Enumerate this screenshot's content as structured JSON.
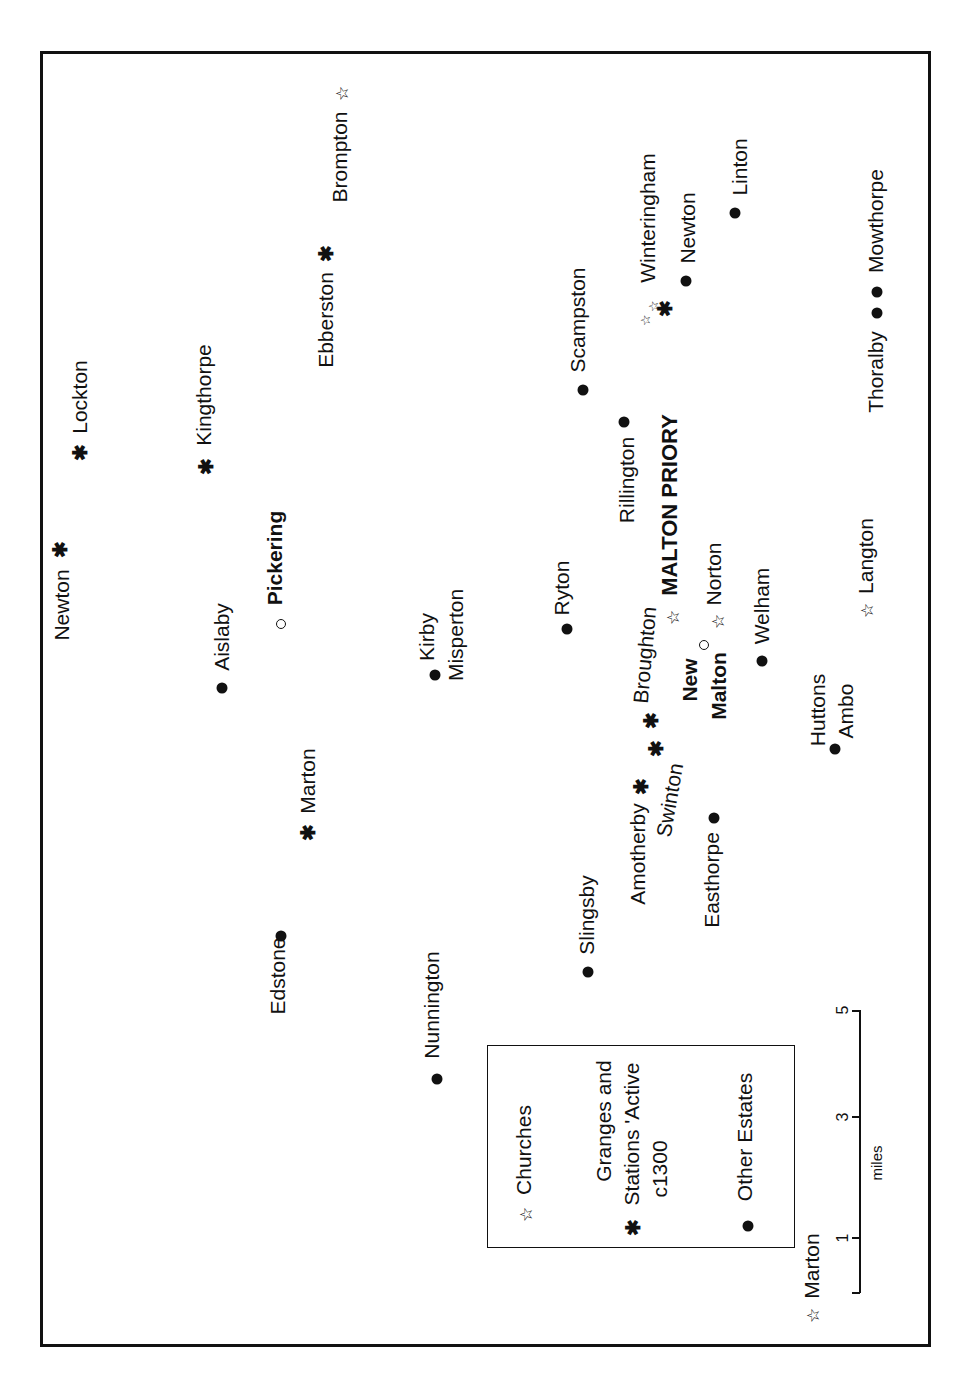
{
  "map": {
    "title": "MALTON PRIORY",
    "places": [
      {
        "id": "lockton",
        "name": "Lockton",
        "type": "grange"
      },
      {
        "id": "kingthorpe",
        "name": "Kingthorpe",
        "type": "grange"
      },
      {
        "id": "ebberston",
        "name": "Ebberston",
        "type": "grange"
      },
      {
        "id": "brompton",
        "name": "Brompton",
        "type": "church"
      },
      {
        "id": "newton-north",
        "name": "Newton",
        "type": "grange"
      },
      {
        "id": "aislaby",
        "name": "Aislaby",
        "type": "estate"
      },
      {
        "id": "pickering",
        "name": "Pickering",
        "type": "town"
      },
      {
        "id": "kirby-misperton",
        "name_line1": "Kirby",
        "name_line2": "Misperton",
        "type": "estate"
      },
      {
        "id": "marton-west",
        "name": "Marton",
        "type": "grange"
      },
      {
        "id": "edstone",
        "name": "Edstone",
        "type": "estate"
      },
      {
        "id": "nunnington",
        "name": "Nunnington",
        "type": "estate"
      },
      {
        "id": "slingsby",
        "name": "Slingsby",
        "type": "estate"
      },
      {
        "id": "amotherby",
        "name": "Amotherby",
        "type": "grange"
      },
      {
        "id": "swinton",
        "name": "Swinton",
        "type": "grange"
      },
      {
        "id": "easthorpe",
        "name": "Easthorpe",
        "type": "estate"
      },
      {
        "id": "broughton",
        "name": "Broughton",
        "type": "grange"
      },
      {
        "id": "ryton",
        "name": "Ryton",
        "type": "estate"
      },
      {
        "id": "rillington",
        "name": "Rillington",
        "type": "estate"
      },
      {
        "id": "scampston",
        "name": "Scampston",
        "type": "estate"
      },
      {
        "id": "malton-priory",
        "name": "MALTON PRIORY",
        "type": "church"
      },
      {
        "id": "new-malton",
        "name_line1": "New",
        "name_line2": "Malton",
        "type": "town"
      },
      {
        "id": "norton",
        "name": "Norton",
        "type": "church"
      },
      {
        "id": "welham",
        "name": "Welham",
        "type": "estate"
      },
      {
        "id": "huttons-ambo",
        "name_line1": "Huttons",
        "name_line2": "Ambo",
        "type": "estate"
      },
      {
        "id": "langton",
        "name": "Langton",
        "type": "church"
      },
      {
        "id": "winteringham",
        "name": "Winteringham",
        "type": "church+grange"
      },
      {
        "id": "newton-east",
        "name": "Newton",
        "type": "estate"
      },
      {
        "id": "linton",
        "name": "Linton",
        "type": "estate"
      },
      {
        "id": "thoralby",
        "name": "Thoralby",
        "type": "estate"
      },
      {
        "id": "mowthorpe",
        "name": "Mowthorpe",
        "type": "estate"
      },
      {
        "id": "marton-south",
        "name": "Marton",
        "type": "church"
      }
    ]
  },
  "legend": {
    "churches": "Churches",
    "granges_line1": "Granges and",
    "granges_line2": "Stations 'Active",
    "granges_line3": "c1300",
    "other_estates": "Other Estates"
  },
  "scale": {
    "unit": "miles",
    "ticks": [
      "1",
      "3",
      "5"
    ]
  },
  "symbols": {
    "church": "☆",
    "grange": "✱",
    "estate": "●",
    "town": "○"
  }
}
